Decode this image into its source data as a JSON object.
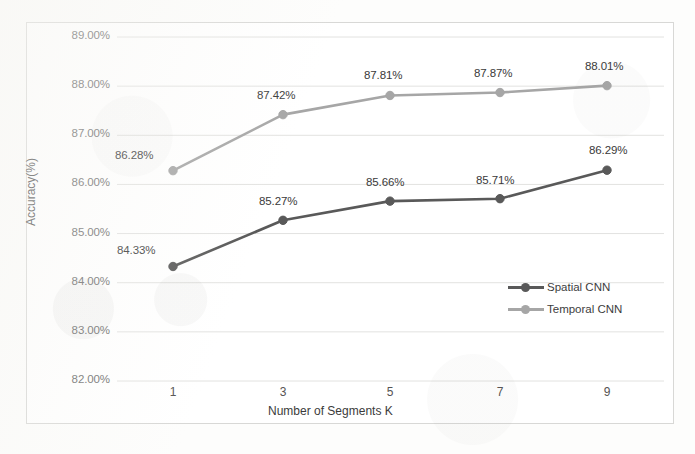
{
  "chart_data": {
    "type": "line",
    "title": "",
    "xlabel": "Number of Segments K",
    "ylabel": "Accuracy(%)",
    "x": [
      1,
      3,
      5,
      7,
      9
    ],
    "categories": [
      "1",
      "3",
      "5",
      "7",
      "9"
    ],
    "ylim": [
      82.0,
      89.0
    ],
    "ytick_values": [
      89.0,
      88.0,
      87.0,
      86.0,
      85.0,
      84.0,
      83.0,
      82.0
    ],
    "ytick_labels": [
      "89.00%",
      "88.00%",
      "87.00%",
      "86.00%",
      "85.00%",
      "84.00%",
      "83.00%",
      "82.00%"
    ],
    "grid": true,
    "legend_position": "inside-right",
    "series": [
      {
        "name": "Spatial CNN",
        "color": "#595959",
        "values": [
          84.33,
          85.27,
          85.66,
          85.71,
          86.29
        ],
        "labels": [
          "84.33%",
          "85.27%",
          "85.66%",
          "85.71%",
          "86.29%"
        ]
      },
      {
        "name": "Temporal CNN",
        "color": "#a6a6a6",
        "values": [
          86.28,
          87.42,
          87.81,
          87.87,
          88.01
        ],
        "labels": [
          "86.28%",
          "87.42%",
          "87.81%",
          "87.87%",
          "88.01%"
        ]
      }
    ]
  },
  "legend": {
    "items": [
      {
        "label": "Spatial CNN",
        "color": "#595959"
      },
      {
        "label": "Temporal CNN",
        "color": "#a6a6a6"
      }
    ]
  },
  "colors": {
    "spatial": "#595959",
    "temporal": "#a6a6a6",
    "grid": "#e2e2e0",
    "frame": "#d8d8d6",
    "text": "#3a3a3a"
  }
}
